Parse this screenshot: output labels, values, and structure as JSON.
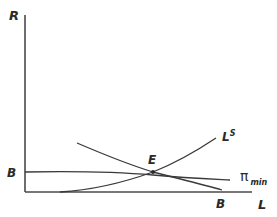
{
  "diagram": {
    "type": "economics-labor-market",
    "axes": {
      "y_label": "R",
      "x_label": "L"
    },
    "curves": [
      {
        "id": "labor-supply",
        "label": "L",
        "label_sup": "S",
        "shape": "convex-increasing"
      },
      {
        "id": "bb-curve",
        "label_start": "B",
        "label_end": "B",
        "shape": "decreasing"
      },
      {
        "id": "pi-min",
        "label": "π",
        "label_sub": "min",
        "shape": "slightly-decreasing"
      }
    ],
    "points": [
      {
        "id": "equilibrium",
        "label": "E"
      }
    ],
    "colors": {
      "line": "#3a3a3a",
      "axis": "#4a4a4a",
      "background": "#ffffff"
    }
  }
}
